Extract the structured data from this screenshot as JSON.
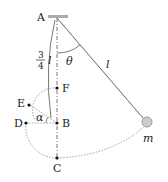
{
  "diagram": {
    "type": "pendulum-physics",
    "points": {
      "A": {
        "label": "A"
      },
      "B": {
        "label": "B"
      },
      "C": {
        "label": "C"
      },
      "D": {
        "label": "D"
      },
      "E": {
        "label": "E"
      },
      "F": {
        "label": "F"
      }
    },
    "labels": {
      "theta": "θ",
      "l": "l",
      "alpha": "α",
      "mass": "m",
      "frac_num": "3",
      "frac_den": "4",
      "frac_l": "l"
    },
    "colors": {
      "line": "#555555",
      "ceiling": "#999999",
      "ball": "#cccccc",
      "dot": "#111111"
    }
  }
}
